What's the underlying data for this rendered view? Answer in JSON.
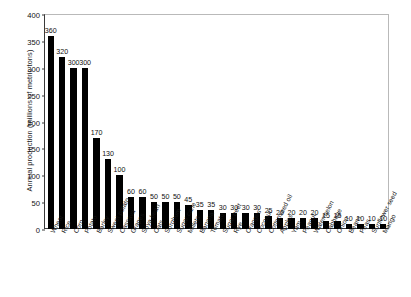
{
  "chart_data": {
    "type": "bar",
    "title": "",
    "xlabel": "",
    "ylabel": "Annual production (millions of metric tons)",
    "ylim": [
      0,
      400
    ],
    "yticks": [
      0,
      50,
      100,
      150,
      200,
      250,
      300,
      350,
      400
    ],
    "grid": false,
    "legend": "none",
    "bar_color": "#000000",
    "categories": [
      "Wheat",
      "Rice",
      "Corn",
      "Potato",
      "Barley",
      "Sweet potato",
      "Cassava",
      "Grapes",
      "Soya bean",
      "Oats",
      "Sorghum",
      "Sugar cane",
      "Millets",
      "Banana",
      "Tomato",
      "Sugar beet",
      "Rye",
      "Oranges",
      "Coconut",
      "Cottonseed oil",
      "Apples",
      "Yam",
      "Peanut",
      "Watermelon",
      "Cabbage",
      "Onion",
      "Beans",
      "Peas",
      "Sunflower seed",
      "Mango"
    ],
    "values": [
      360,
      320,
      300,
      300,
      170,
      130,
      100,
      60,
      60,
      50,
      50,
      50,
      45,
      35,
      35,
      30,
      30,
      30,
      30,
      25,
      20,
      20,
      20,
      20,
      15,
      15,
      10,
      10,
      10,
      10
    ]
  }
}
